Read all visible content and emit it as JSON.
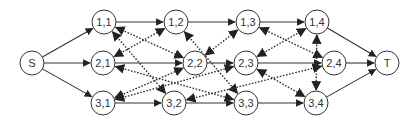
{
  "diagram": {
    "type": "directed-graph",
    "nodes": [
      {
        "id": "S",
        "label": "S",
        "x": 32,
        "y": 63
      },
      {
        "id": "1,1",
        "label": "1,1",
        "x": 104,
        "y": 22
      },
      {
        "id": "2,1",
        "label": "2,1",
        "x": 103,
        "y": 63
      },
      {
        "id": "3,1",
        "label": "3,1",
        "x": 103,
        "y": 103
      },
      {
        "id": "1,2",
        "label": "1,2",
        "x": 176,
        "y": 22
      },
      {
        "id": "2,2",
        "label": "2,2",
        "x": 195,
        "y": 63
      },
      {
        "id": "3,2",
        "label": "3,2",
        "x": 174,
        "y": 103
      },
      {
        "id": "1,3",
        "label": "1,3",
        "x": 248,
        "y": 22
      },
      {
        "id": "2,3",
        "label": "2,3",
        "x": 246,
        "y": 63
      },
      {
        "id": "3,3",
        "label": "3,3",
        "x": 246,
        "y": 103
      },
      {
        "id": "1,4",
        "label": "1,4",
        "x": 317,
        "y": 22
      },
      {
        "id": "2,4",
        "label": "2,4",
        "x": 334,
        "y": 63
      },
      {
        "id": "3,4",
        "label": "3,4",
        "x": 316,
        "y": 103
      },
      {
        "id": "T",
        "label": "T",
        "x": 387,
        "y": 63
      }
    ],
    "solid_edges": [
      [
        "S",
        "1,1"
      ],
      [
        "S",
        "2,1"
      ],
      [
        "S",
        "3,1"
      ],
      [
        "1,1",
        "1,2"
      ],
      [
        "1,2",
        "1,3"
      ],
      [
        "1,3",
        "1,4"
      ],
      [
        "2,1",
        "2,2"
      ],
      [
        "2,2",
        "2,3"
      ],
      [
        "2,3",
        "2,4"
      ],
      [
        "3,1",
        "3,2"
      ],
      [
        "3,2",
        "3,3"
      ],
      [
        "3,3",
        "3,4"
      ],
      [
        "1,4",
        "T"
      ],
      [
        "2,4",
        "T"
      ],
      [
        "3,4",
        "T"
      ]
    ],
    "dotted_bidirectional_edges": [
      [
        "1,1",
        "2,2"
      ],
      [
        "2,1",
        "1,2"
      ],
      [
        "1,1",
        "3,2"
      ],
      [
        "2,1",
        "3,3"
      ],
      [
        "3,1",
        "2,2"
      ],
      [
        "3,1",
        "2,3"
      ],
      [
        "1,2",
        "3,3"
      ],
      [
        "2,2",
        "1,3"
      ],
      [
        "3,2",
        "2,4"
      ],
      [
        "1,3",
        "2,4"
      ],
      [
        "2,3",
        "1,4"
      ],
      [
        "2,3",
        "3,4"
      ],
      [
        "1,4",
        "3,4"
      ]
    ],
    "colors": {
      "stroke": "#333333",
      "node_fill": "#ffffff",
      "background": "#ffffff"
    },
    "node_radius": 12
  }
}
